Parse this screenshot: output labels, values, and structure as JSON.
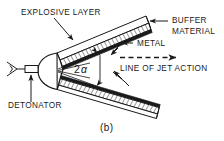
{
  "figure": {
    "caption": "(b)",
    "background_color": "#ffffff",
    "ink_color": "#1a1a1a"
  },
  "labels": {
    "explosive_layer": "EXPLOSIVE LAYER",
    "buffer_material_line1": "BUFFER",
    "buffer_material_line2": "MATERIAL",
    "metal": "METAL",
    "line_of_jet_action": "LINE OF JET ACTION",
    "detonator": "DETONATOR",
    "angle_number": "2",
    "angle_symbol": "α"
  },
  "diagram": {
    "type": "linear-shaped-charge-cross-section",
    "components": [
      "detonator",
      "detonator-cap",
      "upper-arm",
      "lower-arm",
      "buffer-material-strip",
      "explosive-layer-hatched",
      "metal-liner",
      "jet-action-axis"
    ],
    "annotations": [
      "explosive-layer-leader",
      "buffer-material-leader",
      "metal-leader-upper",
      "metal-leader-lower",
      "detonator-leader",
      "angle-brace",
      "jet-dashed-arrow"
    ]
  }
}
